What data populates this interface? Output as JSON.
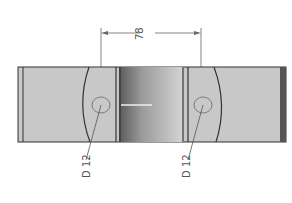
{
  "drawing": {
    "dimension_label": "78",
    "hole_labels": [
      "D 12",
      "D 12"
    ],
    "colors": {
      "body": "#c8c8c8",
      "outline": "#333333",
      "dimension_line": "#666666",
      "text": "#555555"
    }
  }
}
